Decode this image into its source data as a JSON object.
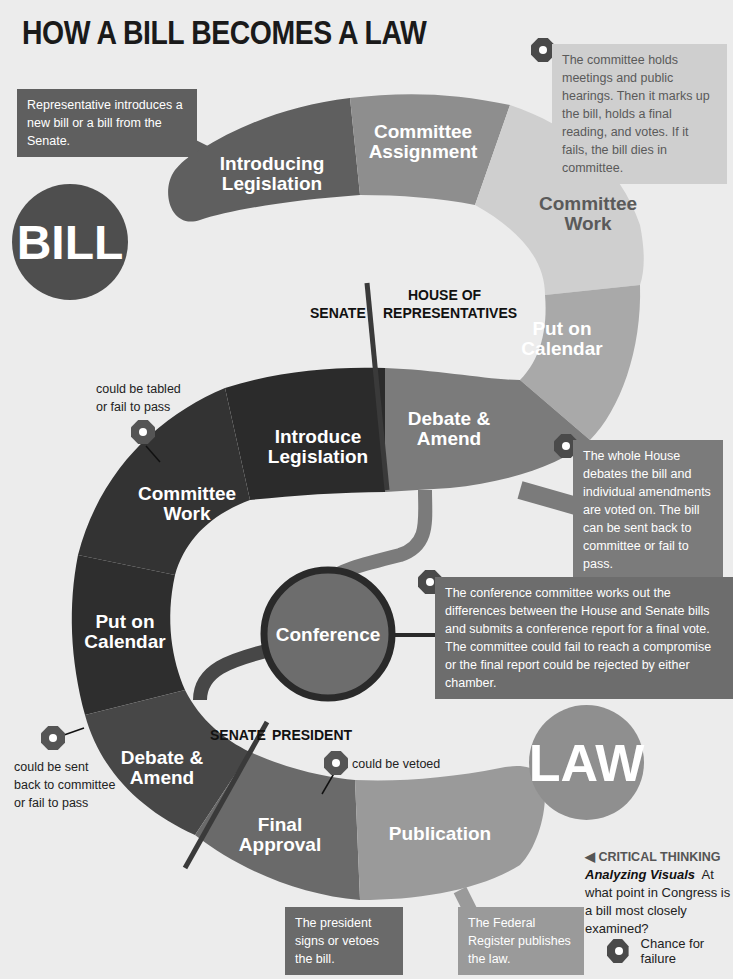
{
  "title": "HOW A BILL BECOMES A LAW",
  "badges": {
    "bill": "BILL",
    "law": "LAW"
  },
  "chambers": {
    "senate_top": "SENATE",
    "house_line1": "HOUSE OF",
    "house_line2": "REPRESENTATIVES",
    "senate_bottom": "SENATE",
    "president": "PRESIDENT"
  },
  "house_steps": [
    {
      "line1": "Introducing",
      "line2": "Legislation",
      "color": "#5f5f5f"
    },
    {
      "line1": "Committee",
      "line2": "Assignment",
      "color": "#8e8e8e"
    },
    {
      "line1": "Committee",
      "line2": "Work",
      "color": "#cfcfcf"
    },
    {
      "line1": "Put on",
      "line2": "Calendar",
      "color": "#a9a9a9"
    },
    {
      "line1": "Debate &",
      "line2": "Amend",
      "color": "#7b7b7b"
    }
  ],
  "senate_steps": [
    {
      "line1": "Introduce",
      "line2": "Legislation",
      "color": "#2b2b2b"
    },
    {
      "line1": "Committee",
      "line2": "Work",
      "color": "#333333"
    },
    {
      "line1": "Put on",
      "line2": "Calendar",
      "color": "#2e2e2e"
    },
    {
      "line1": "Debate &",
      "line2": "Amend",
      "color": "#474747"
    }
  ],
  "conference": {
    "label": "Conference",
    "color": "#6d6d6d",
    "border": "#2a2a2a"
  },
  "president_steps": [
    {
      "line1": "Final",
      "line2": "Approval",
      "color": "#6a6a6a"
    },
    {
      "line1": "Publication",
      "line2": "",
      "color": "#9a9a9a"
    }
  ],
  "callouts": {
    "introduce": "Representative introduces a new bill or a bill from the Senate.",
    "committee_work": "The committee holds meetings and public hearings. Then it marks up the bill, holds a final reading, and votes. If it fails, the bill dies in committee.",
    "debate_house": "The whole House debates the bill and individual amendments are voted on. The bill can be sent back to committee or fail to pass.",
    "conference": "The conference committee works out the differences between the House and Senate bills and submits a conference report for a final vote. The committee could fail to reach a compromise or the final report could be rejected by either chamber.",
    "president": "The president signs or vetoes the bill.",
    "publication": "The Federal Register publishes the law."
  },
  "notes": {
    "tabled_line1": "could be tabled",
    "tabled_line2": "or fail to pass",
    "sent_back_line1": "could be sent",
    "sent_back_line2": "back to committee",
    "sent_back_line3": "or fail to pass",
    "vetoed": "could be vetoed"
  },
  "critical_thinking": {
    "heading": "◀ CRITICAL THINKING",
    "subheading": "Analyzing Visuals",
    "question": "At what point in Congress is a bill most closely examined?"
  },
  "legend": {
    "label": "Chance for failure"
  },
  "page_number": "208"
}
